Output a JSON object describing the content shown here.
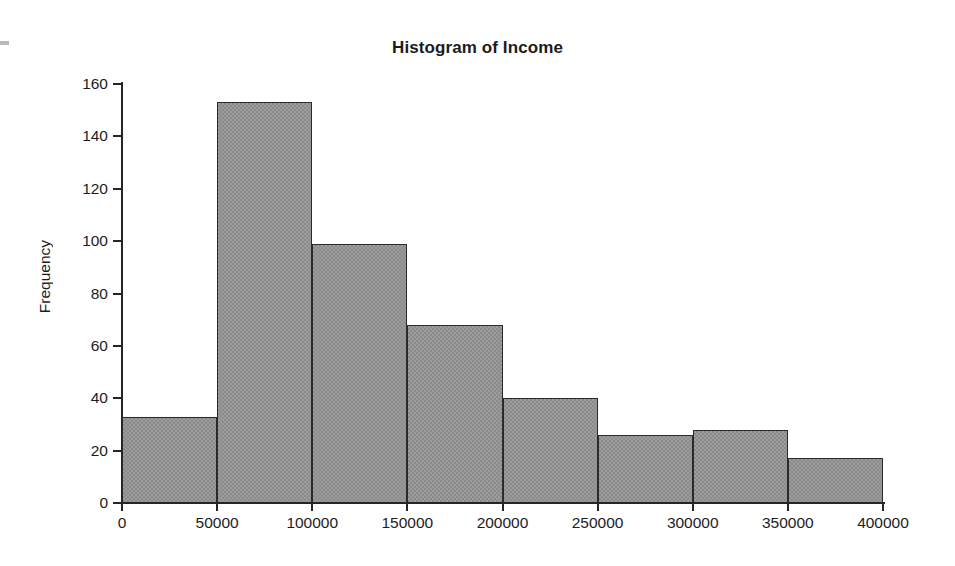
{
  "chart_data": {
    "type": "bar",
    "title": "Histogram of Income",
    "xlabel": "",
    "ylabel": "Frequency",
    "xlim": [
      0,
      400000
    ],
    "ylim": [
      0,
      160
    ],
    "grid": false,
    "legend": null,
    "bin_width": 50000,
    "bin_edges": [
      0,
      50000,
      100000,
      150000,
      200000,
      250000,
      300000,
      350000,
      400000
    ],
    "categories": [
      "0-50000",
      "50000-100000",
      "100000-150000",
      "150000-200000",
      "200000-250000",
      "250000-300000",
      "300000-350000",
      "350000-400000"
    ],
    "values": [
      33,
      153,
      99,
      68,
      40,
      26,
      28,
      17
    ],
    "xticks": [
      0,
      50000,
      100000,
      150000,
      200000,
      250000,
      300000,
      350000,
      400000
    ],
    "xtick_labels": [
      "0",
      "50000",
      "100000",
      "150000",
      "200000",
      "250000",
      "300000",
      "350000",
      "400000"
    ],
    "yticks": [
      0,
      20,
      40,
      60,
      80,
      100,
      120,
      140,
      160
    ],
    "ytick_labels": [
      "0",
      "20",
      "40",
      "60",
      "80",
      "100",
      "120",
      "140",
      "160"
    ],
    "bar_fill_color": "#9d9d9d",
    "bar_edge_color": "#2b2b2b",
    "axis_color": "#262626",
    "text_color": "#1c1c1c",
    "background_color": "#ffffff"
  }
}
